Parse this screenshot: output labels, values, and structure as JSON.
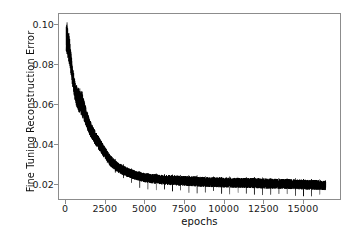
{
  "chart_data": {
    "type": "line",
    "title": "",
    "xlabel": "epochs",
    "ylabel": "Fine Tuning Reconstruction Error",
    "xlim": [
      -450,
      17400
    ],
    "ylim": [
      0.0118,
      0.1055
    ],
    "xticks": [
      0,
      2500,
      5000,
      7500,
      10000,
      12500,
      15000
    ],
    "xtick_labels": [
      "0",
      "2500",
      "5000",
      "7500",
      "10000",
      "12500",
      "15000"
    ],
    "yticks": [
      0.02,
      0.04,
      0.06,
      0.08,
      0.1
    ],
    "ytick_labels": [
      "0.02",
      "0.04",
      "0.06",
      "0.08",
      "0.10"
    ],
    "grid": false,
    "legend": false,
    "line_color": "#000000",
    "line_width": 0.7,
    "spine_color": "#8c8c8c",
    "background": "#ffffff",
    "series": [
      {
        "name": "Fine Tuning Reconstruction Error",
        "description": "Noisy training-loss curve: steep decay from ~0.101 near epoch 0 to a noisy plateau near 0.018-0.020 after epoch ~5000; dense high-frequency oscillation band with periodic downward spikes.",
        "n_points": 16500,
        "x_start": 0,
        "x_end": 16500,
        "y_start": 0.1012,
        "y_end": 0.0175,
        "envelope_x": [
          0,
          200,
          400,
          600,
          800,
          1000,
          1200,
          1500,
          1800,
          2100,
          2400,
          2800,
          3200,
          3600,
          4000,
          4500,
          5000,
          5500,
          6000,
          6500,
          7000,
          7500,
          8000,
          9000,
          10000,
          11000,
          12000,
          13000,
          14000,
          15000,
          16000,
          16500
        ],
        "envelope_upper": [
          0.1012,
          0.0955,
          0.08,
          0.07,
          0.068,
          0.0672,
          0.06,
          0.052,
          0.047,
          0.043,
          0.039,
          0.034,
          0.0308,
          0.0288,
          0.0272,
          0.0258,
          0.0248,
          0.0243,
          0.024,
          0.0238,
          0.0236,
          0.0234,
          0.0232,
          0.0228,
          0.0226,
          0.0224,
          0.0222,
          0.022,
          0.0218,
          0.0215,
          0.0212,
          0.021
        ],
        "envelope_lower": [
          0.087,
          0.08,
          0.069,
          0.06,
          0.056,
          0.054,
          0.05,
          0.044,
          0.04,
          0.0365,
          0.033,
          0.0285,
          0.0258,
          0.024,
          0.0228,
          0.0214,
          0.0204,
          0.0198,
          0.0194,
          0.019,
          0.0188,
          0.0186,
          0.0184,
          0.018,
          0.0178,
          0.0176,
          0.0174,
          0.0172,
          0.017,
          0.0168,
          0.0166,
          0.0164
        ],
        "spike_depth": 0.0035,
        "spike_period": 520
      }
    ]
  },
  "axis": {
    "ylabel_text": "Fine Tuning Reconstruction Error",
    "xlabel_text": "epochs"
  }
}
